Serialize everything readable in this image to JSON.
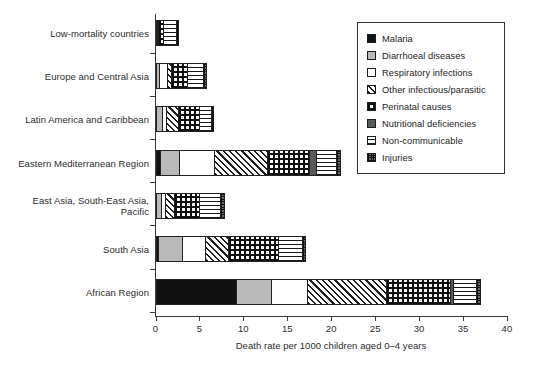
{
  "chart_data": {
    "type": "bar",
    "orientation": "horizontal",
    "stacked": true,
    "title": "",
    "xlabel": "Death rate per 1000 children aged 0–4 years",
    "ylabel": "",
    "xlim": [
      0,
      40
    ],
    "xticks": [
      0,
      5,
      10,
      15,
      20,
      25,
      30,
      35,
      40
    ],
    "xtick_labels": [
      "0",
      "5",
      "10",
      "15",
      "20",
      "25",
      "30",
      "35",
      "40"
    ],
    "grid": false,
    "legend_position": "top-right",
    "categories": [
      "Low-mortality countries",
      "Europe and Central Asia",
      "Latin America and Caribbean",
      "Eastern Mediterranean Region",
      "East Asia, South-East Asia,\nPacific",
      "South Asia",
      "African Region"
    ],
    "series": [
      {
        "name": "Malaria",
        "pattern": "solid-black",
        "values": [
          0.0,
          0.0,
          0.0,
          0.5,
          0.0,
          0.3,
          9.2
        ]
      },
      {
        "name": "Diarrhoeal diseases",
        "pattern": "solid-lightgrey",
        "values": [
          0.0,
          0.4,
          0.7,
          2.2,
          0.6,
          2.7,
          3.9
        ]
      },
      {
        "name": "Respiratory infections",
        "pattern": "solid-white",
        "values": [
          0.2,
          0.9,
          0.5,
          4.0,
          0.5,
          2.6,
          4.1
        ]
      },
      {
        "name": "Other infectious/parasitic",
        "pattern": "diagonal-hatch",
        "values": [
          0.1,
          0.5,
          1.4,
          6.0,
          1.0,
          2.6,
          9.0
        ]
      },
      {
        "name": "Perinatal causes",
        "pattern": "cross-hatch",
        "values": [
          0.5,
          1.8,
          2.3,
          4.8,
          2.9,
          5.8,
          7.3
        ]
      },
      {
        "name": "Nutritional deficiencies",
        "pattern": "solid-darkgrey",
        "values": [
          0.0,
          0.0,
          0.0,
          0.8,
          0.0,
          0.0,
          0.4
        ]
      },
      {
        "name": "Non-communicable",
        "pattern": "horizontal-line",
        "values": [
          1.5,
          1.8,
          1.4,
          2.2,
          2.4,
          2.7,
          2.6
        ]
      },
      {
        "name": "Injuries",
        "pattern": "fine-grid",
        "values": [
          0.4,
          0.5,
          0.4,
          0.6,
          0.5,
          0.4,
          0.5
        ]
      }
    ],
    "totals": [
      2.7,
      5.9,
      6.7,
      21.1,
      7.9,
      17.1,
      37.0
    ],
    "colors": {
      "malaria": "#111111",
      "diarrhoeal": "#b9b9b9",
      "respiratory": "#ffffff",
      "nutritional": "#5a5a5a",
      "injuries": "#6b6b6b",
      "axis": "#3a3a3a",
      "text": "#2b2b2b"
    }
  },
  "legend": {
    "items": [
      {
        "label": "Malaria",
        "swatch": "malaria-swatch"
      },
      {
        "label": "Diarrhoeal diseases",
        "swatch": "diarrhoeal-swatch"
      },
      {
        "label": "Respiratory infections",
        "swatch": "respiratory-swatch"
      },
      {
        "label": "Other infectious/parasitic",
        "swatch": "other-infectious-swatch"
      },
      {
        "label": "Perinatal causes",
        "swatch": "perinatal-swatch"
      },
      {
        "label": "Nutritional deficiencies",
        "swatch": "nutritional-swatch"
      },
      {
        "label": "Non-communicable",
        "swatch": "non-communicable-swatch"
      },
      {
        "label": "Injuries",
        "swatch": "injuries-swatch"
      }
    ]
  }
}
